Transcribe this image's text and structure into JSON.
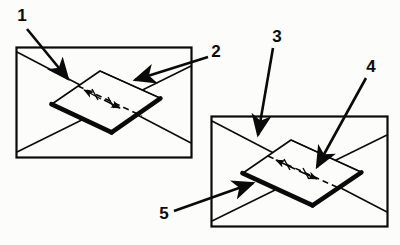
{
  "figure": {
    "background_color": "#fcfcfb",
    "line_color": "#0a0a0a",
    "callout_labels": [
      {
        "id": "1",
        "text": "1",
        "x": 22,
        "y": 17
      },
      {
        "id": "2",
        "text": "2",
        "x": 216,
        "y": 53
      },
      {
        "id": "3",
        "text": "3",
        "x": 277,
        "y": 38
      },
      {
        "id": "4",
        "text": "4",
        "x": 371,
        "y": 68
      },
      {
        "id": "5",
        "text": "5",
        "x": 164,
        "y": 215
      }
    ],
    "views": [
      {
        "name": "left-view",
        "frame": {
          "x": 16,
          "y": 47,
          "width": 176,
          "height": 111
        },
        "plate": "tilted rectangular plate with thick lower-left edges",
        "axis": "dashed centre line with small arrowheads"
      },
      {
        "name": "right-view",
        "frame": {
          "x": 211,
          "y": 116,
          "width": 177,
          "height": 111
        },
        "plate": "tilted rectangular plate with thick lower-left edges",
        "axis": "dashed centre line with small arrowheads"
      }
    ]
  }
}
